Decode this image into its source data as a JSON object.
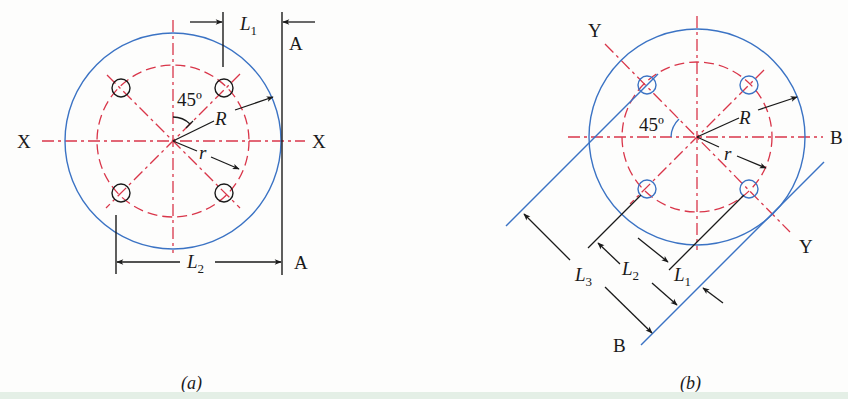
{
  "figure": {
    "colors": {
      "outline": "#3b73c4",
      "centerline": "#d9364a",
      "dimension": "#1a1a1a",
      "background": "#fdfdfc",
      "bottom_strip": "#e4efe6"
    },
    "panel_a": {
      "caption": "(a)",
      "axis_left_label": "X",
      "axis_right_label": "X",
      "reference_top_label": "A",
      "reference_bottom_label": "A",
      "angle_label": "45º",
      "outer_radius_label": "R",
      "bolt_circle_radius_label": "r",
      "dimension_1": {
        "symbol": "L",
        "subscript": "1"
      },
      "dimension_2": {
        "symbol": "L",
        "subscript": "2"
      },
      "hole_count": 4
    },
    "panel_b": {
      "caption": "(b)",
      "diagonal_axis_top_label": "Y",
      "diagonal_axis_bottom_label": "Y",
      "reference_right_label": "B",
      "reference_bottom_label": "B",
      "angle_label": "45º",
      "outer_radius_label": "R",
      "bolt_circle_radius_label": "r",
      "dimension_1": {
        "symbol": "L",
        "subscript": "1"
      },
      "dimension_2": {
        "symbol": "L",
        "subscript": "2"
      },
      "dimension_3": {
        "symbol": "L",
        "subscript": "3"
      },
      "hole_count": 4
    }
  }
}
